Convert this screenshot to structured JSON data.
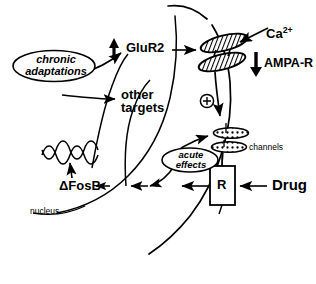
{
  "figure": {
    "kind": "neuroscience-signaling-diagram",
    "background_color": "#ffffff",
    "ink_color": "#000000"
  },
  "labels": {
    "glur2": "GluR2",
    "glur2_arrow": "up-arrow",
    "ampa_r": "AMPA-R",
    "ampa_r_arrow": "down-arrow",
    "calcium": "Ca",
    "calcium_charge": "2+",
    "other_targets_line1": "other",
    "other_targets_line2": "targets",
    "chronic_line1": "chronic",
    "chronic_line2": "adaptations",
    "acute_line1": "acute",
    "acute_line2": "effects",
    "delta_fosb": "ΔFosB",
    "nucleus": "nucleus",
    "channels": "channels",
    "receptor": "R",
    "drug": "Drug",
    "plus_symbol": "⊕"
  },
  "icons": {
    "ampa_receptor": "hatched-ellipse-pair-icon",
    "ion_channel": "stippled-ellipse-icon",
    "dna": "dna-squiggle-icon",
    "up_arrow": "up-arrow-icon",
    "down_arrow": "down-arrow-icon",
    "plus_circle": "plus-circle-icon"
  },
  "colors": {
    "stroke": "#000000",
    "fill_white": "#ffffff",
    "hatch": "#000000"
  }
}
